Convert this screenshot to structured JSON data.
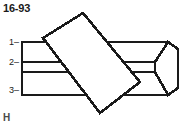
{
  "figure": {
    "title": "16-93",
    "watermark": "H",
    "background_color": "#ffffff",
    "line_color": "#1a1a1a",
    "fill_color": "#ffffff",
    "callouts": [
      {
        "id": "1",
        "label": "1",
        "leader": "–"
      },
      {
        "id": "2",
        "label": "2",
        "leader": "–"
      },
      {
        "id": "3",
        "label": "3",
        "leader": "–"
      }
    ]
  },
  "icons": {
    "leader_dash": "leader-dash-icon"
  }
}
